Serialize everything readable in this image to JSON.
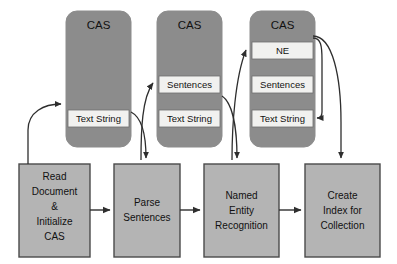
{
  "diagram": {
    "colors": {
      "cas_fill": "#8c8c8c",
      "band_fill": "#f1f1ef",
      "process_fill": "#b4b4b4",
      "arrow": "#2e2e2e",
      "background": "#ffffff",
      "text": "#111111"
    },
    "cas_structures": [
      {
        "id": "cas-1",
        "title": "CAS",
        "bands": [
          "Text String"
        ]
      },
      {
        "id": "cas-2",
        "title": "CAS",
        "bands": [
          "Sentences",
          "Text String"
        ]
      },
      {
        "id": "cas-3",
        "title": "CAS",
        "bands": [
          "NE",
          "Sentences",
          "Text String"
        ]
      }
    ],
    "process_steps": [
      {
        "id": "read-document",
        "lines": [
          "Read",
          "Document",
          "&",
          "Initialize",
          "CAS"
        ]
      },
      {
        "id": "parse-sentences",
        "lines": [
          "Parse",
          "Sentences"
        ]
      },
      {
        "id": "named-entity-recognition",
        "lines": [
          "Named",
          "Entity",
          "Recognition"
        ]
      },
      {
        "id": "create-index",
        "lines": [
          "Create",
          "Index for",
          "Collection"
        ]
      }
    ],
    "connections": [
      {
        "id": "read-to-cas1-textstring",
        "kind": "curve"
      },
      {
        "id": "cas1-textstring-to-parse",
        "kind": "curve"
      },
      {
        "id": "parse-to-cas2-sentences",
        "kind": "curve"
      },
      {
        "id": "cas2-textstring-to-ner",
        "kind": "curve"
      },
      {
        "id": "ner-to-cas3-ne",
        "kind": "curve"
      },
      {
        "id": "cas3-to-cas3-textstring",
        "kind": "curve"
      },
      {
        "id": "cas3-to-create-index",
        "kind": "curve"
      },
      {
        "id": "read-to-parse",
        "kind": "straight"
      },
      {
        "id": "parse-to-ner",
        "kind": "straight"
      },
      {
        "id": "ner-to-create-index",
        "kind": "straight"
      }
    ]
  }
}
